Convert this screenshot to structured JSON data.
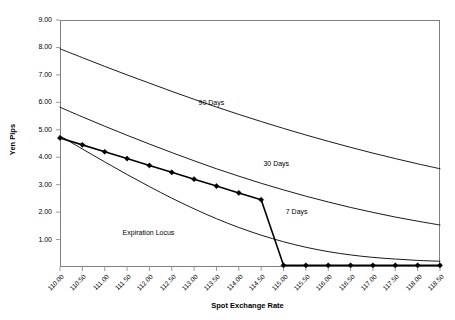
{
  "chart_data": {
    "type": "line",
    "title": "",
    "xlabel": "Spot Exchange Rate",
    "ylabel": "Yen Pips",
    "xlim": [
      110.0,
      118.5
    ],
    "ylim": [
      0.0,
      9.0
    ],
    "grid": false,
    "legend_position": "inline-annotations",
    "x_tick_labels": [
      "110.00",
      "110.50",
      "111.00",
      "111.50",
      "112.00",
      "112.50",
      "113.00",
      "113.50",
      "114.00",
      "114.50",
      "115.00",
      "115.50",
      "116.00",
      "116.50",
      "117.00",
      "117.50",
      "118.00",
      "118.50"
    ],
    "y_tick_labels": [
      "1.00",
      "2.00",
      "3.00",
      "4.00",
      "5.00",
      "6.00",
      "7.00",
      "8.00",
      "9.00"
    ],
    "y_tick_values": [
      1.0,
      2.0,
      3.0,
      4.0,
      5.0,
      6.0,
      7.0,
      8.0,
      9.0
    ],
    "x": [
      110.0,
      110.5,
      111.0,
      111.5,
      112.0,
      112.5,
      113.0,
      113.5,
      114.0,
      114.5,
      115.0,
      115.5,
      116.0,
      116.5,
      117.0,
      117.5,
      118.0,
      118.5
    ],
    "series": [
      {
        "name": "90 Days",
        "label": "90 Days",
        "marker": "none",
        "color": "#000000",
        "values": [
          7.95,
          7.63,
          7.31,
          7.0,
          6.7,
          6.4,
          6.11,
          5.83,
          5.56,
          5.3,
          5.05,
          4.81,
          4.58,
          4.36,
          4.15,
          3.95,
          3.76,
          3.58
        ]
      },
      {
        "name": "30 Days",
        "label": "30 Days",
        "marker": "none",
        "color": "#000000",
        "values": [
          5.82,
          5.47,
          5.13,
          4.8,
          4.48,
          4.17,
          3.87,
          3.58,
          3.31,
          3.05,
          2.81,
          2.58,
          2.37,
          2.17,
          1.99,
          1.82,
          1.67,
          1.53
        ]
      },
      {
        "name": "7 Days",
        "label": "7 Days",
        "marker": "none",
        "color": "#000000",
        "values": [
          4.78,
          4.3,
          3.83,
          3.37,
          2.93,
          2.51,
          2.12,
          1.76,
          1.44,
          1.16,
          0.92,
          0.72,
          0.56,
          0.44,
          0.35,
          0.29,
          0.24,
          0.21
        ]
      },
      {
        "name": "Expiration Locus",
        "label": "Expiration Locus",
        "marker": "diamond",
        "color": "#000000",
        "values": [
          4.7,
          4.45,
          4.2,
          3.95,
          3.7,
          3.45,
          3.2,
          2.95,
          2.7,
          2.45,
          0.06,
          0.06,
          0.06,
          0.06,
          0.06,
          0.06,
          0.06,
          0.06
        ]
      }
    ],
    "annotations": [
      {
        "text": "90 Days",
        "x": 113.1,
        "y": 5.95
      },
      {
        "text": "30 Days",
        "x": 114.55,
        "y": 3.72
      },
      {
        "text": "7 Days",
        "x": 115.05,
        "y": 1.98
      },
      {
        "text": "Expiration Locus",
        "x": 111.4,
        "y": 1.22
      }
    ]
  }
}
